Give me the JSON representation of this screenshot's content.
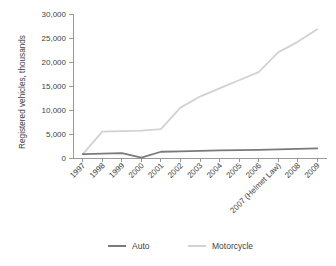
{
  "chart_data": {
    "type": "line",
    "title": "",
    "xlabel": "",
    "ylabel": "Registered vehicles, thousands",
    "categories": [
      "1997",
      "1998",
      "1999",
      "2000",
      "2001",
      "2002",
      "2003",
      "2004",
      "2005",
      "2006",
      "2007 (Helmet Law)",
      "2008",
      "2009"
    ],
    "ylim": [
      0,
      30000
    ],
    "yticks": [
      0,
      5000,
      10000,
      15000,
      20000,
      25000,
      30000
    ],
    "ytick_labels": [
      "0",
      "5,000",
      "10,000",
      "15,000",
      "20,000",
      "25,000",
      "30,000"
    ],
    "grid": false,
    "legend_position": "bottom",
    "series": [
      {
        "name": "Auto",
        "color": "#7a7a7a",
        "values": [
          800,
          900,
          1000,
          100,
          1300,
          1400,
          1500,
          1600,
          1650,
          1700,
          1800,
          1900,
          2000
        ]
      },
      {
        "name": "Motorcycle",
        "color": "#d2d2d2",
        "values": [
          800,
          5500,
          5600,
          5700,
          6000,
          10500,
          12800,
          14500,
          16200,
          17900,
          22000,
          24200,
          26800
        ]
      }
    ]
  },
  "axis": {
    "y_label": "Registered vehicles, thousands",
    "y_tick_labels": [
      "30,000",
      "25,000",
      "20,000",
      "15,000",
      "10,000",
      "5,000",
      "0"
    ],
    "x_tick_labels": [
      "1997",
      "1998",
      "1999",
      "2000",
      "2001",
      "2002",
      "2003",
      "2004",
      "2005",
      "2006",
      "2007 (Helmet Law)",
      "2008",
      "2009"
    ]
  },
  "legend": {
    "items": [
      {
        "label": "Auto",
        "color": "#7a7a7a"
      },
      {
        "label": "Motorcycle",
        "color": "#d2d2d2"
      }
    ]
  },
  "colors": {
    "auto": "#7a7a7a",
    "motorcycle": "#d2d2d2",
    "axis": "#9a9a9a",
    "text": "#3f3f3f",
    "background": "#ffffff"
  }
}
